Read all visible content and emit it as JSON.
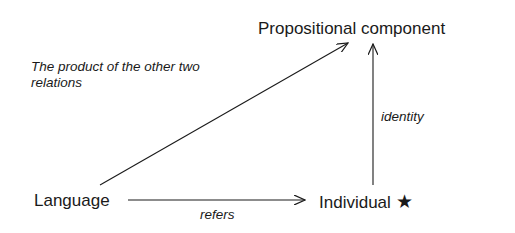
{
  "diagram": {
    "nodes": {
      "propositional": {
        "label": "Propositional component"
      },
      "language": {
        "label": "Language"
      },
      "individual": {
        "label": "Individual",
        "marker": "★",
        "marker_icon": "star-icon"
      }
    },
    "edges": {
      "product": {
        "from": "Language",
        "to": "Propositional component",
        "label_line1": "The product of the other two",
        "label_line2": "relations"
      },
      "identity": {
        "from": "Individual",
        "to": "Propositional component",
        "label": "identity"
      },
      "refers": {
        "from": "Language",
        "to": "Individual",
        "label": "refers"
      }
    }
  }
}
